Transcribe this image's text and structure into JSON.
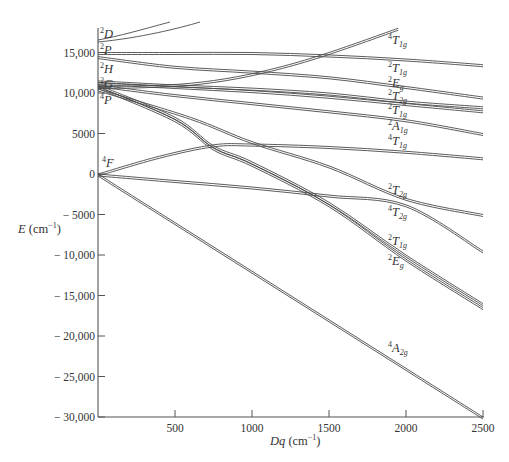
{
  "chart_data": {
    "type": "line",
    "title": "",
    "xlabel": "Dq (cm⁻¹)",
    "ylabel": "E (cm⁻¹)",
    "xlim": [
      0,
      2500
    ],
    "ylim": [
      -30000,
      18000
    ],
    "grid": false,
    "legend": "none",
    "x_ticks": [
      500,
      1000,
      1500,
      2000,
      2500
    ],
    "x_tick_labels": [
      "500",
      "1000",
      "1500",
      "2000",
      "2500"
    ],
    "y_ticks": [
      15000,
      10000,
      5000,
      0,
      -5000,
      -10000,
      -15000,
      -20000,
      -25000,
      -30000
    ],
    "y_tick_labels": [
      "15,000",
      "10,000",
      "5000",
      "0",
      "− 5000",
      "− 10,000",
      "− 15,000",
      "− 20,000",
      "− 25,000",
      "− 30,000"
    ],
    "free_ion_terms": [
      {
        "term": "2D",
        "sup": "2",
        "letter": "D",
        "energy": 16500
      },
      {
        "term": "2P",
        "sup": "2",
        "letter": "P",
        "energy": 15000
      },
      {
        "term": "2H",
        "sup": "2",
        "letter": "H",
        "energy": 14500
      },
      {
        "term": "2G",
        "sup": "2",
        "letter": "G",
        "energy": 11500
      },
      {
        "term": "4P",
        "sup": "4",
        "letter": "P",
        "energy": 10800
      },
      {
        "term": "4F",
        "sup": "4",
        "letter": "F",
        "energy": 0
      }
    ],
    "series": [
      {
        "name": "4T1g (upper)",
        "sup": "4",
        "letter": "T",
        "sub": "1g",
        "x": [
          0,
          300,
          600,
          900,
          1200,
          1500,
          1950
        ],
        "y": [
          10800,
          10900,
          11200,
          12000,
          13300,
          15000,
          18000
        ]
      },
      {
        "name": "2T1g (top)",
        "sup": "2",
        "letter": "T",
        "sub": "1g",
        "x": [
          0,
          500,
          1000,
          1500,
          2000,
          2500
        ],
        "y": [
          15000,
          15000,
          15000,
          14700,
          14200,
          13500
        ]
      },
      {
        "name": "2Eg (upper)",
        "sup": "2",
        "letter": "E",
        "sub": "g",
        "x": [
          0,
          500,
          1000,
          1500,
          2000,
          2500
        ],
        "y": [
          14500,
          13300,
          12700,
          12000,
          10800,
          9500
        ]
      },
      {
        "name": "2T2g (upper)",
        "sup": "2",
        "letter": "T",
        "sub": "2g",
        "x": [
          0,
          500,
          1000,
          1500,
          2000,
          2500
        ],
        "y": [
          11500,
          11000,
          10600,
          10000,
          9000,
          8300
        ]
      },
      {
        "name": "2T1g (mid)",
        "sup": "2",
        "letter": "T",
        "sub": "1g",
        "x": [
          0,
          500,
          1000,
          1500,
          2000,
          2500
        ],
        "y": [
          11300,
          10800,
          10300,
          9600,
          8700,
          7800
        ]
      },
      {
        "name": "2A1g",
        "sup": "2",
        "letter": "A",
        "sub": "1g",
        "x": [
          0,
          500,
          1000,
          1500,
          2000,
          2500
        ],
        "y": [
          11000,
          9800,
          8800,
          7800,
          6700,
          5000
        ]
      },
      {
        "name": "4T1g (lower)",
        "sup": "4",
        "letter": "T",
        "sub": "1g",
        "x": [
          0,
          400,
          750,
          1000,
          1500,
          2000,
          2500
        ],
        "y": [
          0,
          2200,
          3600,
          3700,
          3400,
          2800,
          2000
        ]
      },
      {
        "name": "2T2g (lower)",
        "sup": "2",
        "letter": "T",
        "sub": "2g",
        "x": [
          0,
          600,
          1000,
          1500,
          2000,
          2500
        ],
        "y": [
          10500,
          7000,
          4000,
          1000,
          -3000,
          -5000
        ]
      },
      {
        "name": "4T2g",
        "sup": "4",
        "letter": "T",
        "sub": "2g",
        "x": [
          0,
          500,
          1000,
          1500,
          2000,
          2500
        ],
        "y": [
          0,
          -800,
          -1600,
          -2600,
          -3800,
          -9500
        ]
      },
      {
        "name": "2T1g (lower)",
        "sup": "2",
        "letter": "T",
        "sub": "1g",
        "x": [
          0,
          500,
          750,
          1000,
          1500,
          2000,
          2500
        ],
        "y": [
          11000,
          7000,
          3500,
          1500,
          -3500,
          -10000,
          -16000
        ]
      },
      {
        "name": "2Eg (lower)",
        "sup": "2",
        "letter": "E",
        "sub": "g",
        "x": [
          0,
          500,
          750,
          1000,
          1500,
          2000,
          2500
        ],
        "y": [
          10800,
          6700,
          3200,
          1200,
          -3800,
          -10500,
          -16500
        ]
      },
      {
        "name": "4A2g",
        "sup": "4",
        "letter": "A",
        "sub": "2g",
        "x": [
          0,
          500,
          1000,
          1500,
          2000,
          2500
        ],
        "y": [
          0,
          -6000,
          -12000,
          -18000,
          -24000,
          -30000
        ]
      }
    ],
    "annotations": [
      "4T1g",
      "2T1g",
      "2Eg",
      "2T2g",
      "2T1g",
      "2A1g",
      "4T1g",
      "2T2g",
      "4T2g",
      "2T1g",
      "2Eg",
      "4A2g"
    ]
  },
  "axes": {
    "x_label_main": "Dq",
    "x_label_unit": " (cm",
    "x_label_exp": "−1",
    "x_label_close": ")",
    "y_label_main": "E",
    "y_label_unit": " (cm",
    "y_label_exp": "−1",
    "y_label_close": ")"
  }
}
